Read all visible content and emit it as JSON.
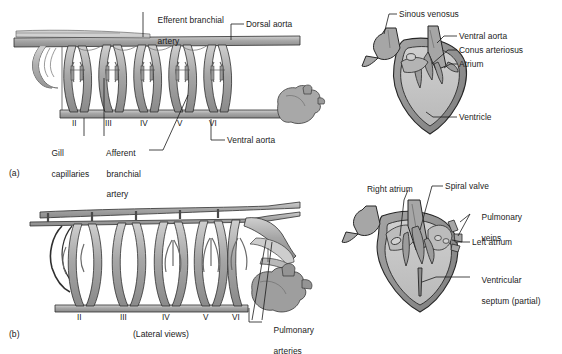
{
  "figure": {
    "caption": "(Lateral views)",
    "panels": [
      {
        "tag": "(a)",
        "name": "fish-aortic-arches-and-heart"
      },
      {
        "tag": "(b)",
        "name": "amphibian-aortic-arches-and-heart"
      }
    ]
  },
  "panel_a_arches": {
    "name": "fish-gill-circulation",
    "labels": {
      "efferent_branchial_artery_line1": "Efferent branchial",
      "efferent_branchial_artery_line2": "artery",
      "dorsal_aorta": "Dorsal aorta",
      "gill_capillaries_line1": "Gill",
      "gill_capillaries_line2": "capillaries",
      "afferent_branchial_artery_line1": "Afferent",
      "afferent_branchial_artery_line2": "branchial",
      "afferent_branchial_artery_line3": "artery",
      "ventral_aorta": "Ventral aorta"
    },
    "arch_numerals": [
      "II",
      "III",
      "IV",
      "V",
      "VI"
    ]
  },
  "panel_a_heart": {
    "name": "fish-heart-section",
    "labels": {
      "sinous_venosus": "Sinous venosus",
      "ventral_aorta": "Ventral aorta",
      "conus_arteriosus": "Conus arteriosus",
      "atrium": "Atrium",
      "ventricle": "Ventricle"
    }
  },
  "panel_b_arches": {
    "name": "amphibian-gill-circulation",
    "labels": {
      "pulmonary_arteries_line1": "Pulmonary",
      "pulmonary_arteries_line2": "arteries"
    },
    "arch_numerals": [
      "II",
      "III",
      "IV",
      "V",
      "VI"
    ]
  },
  "panel_b_heart": {
    "name": "amphibian-heart-section",
    "labels": {
      "right_atrium": "Right atrium",
      "spiral_valve": "Spiral valve",
      "pulmonary_veins_line1": "Pulmonary",
      "pulmonary_veins_line2": "veins",
      "left_atrium": "Left atrium",
      "ventricular_septum_line1": "Ventricular",
      "ventricular_septum_line2": "septum (partial)"
    }
  },
  "colors": {
    "background": "#ffffff",
    "vessel_fill": "#9c9c9c",
    "vessel_fill_light": "#bdbdbd",
    "vessel_outline": "#2e2e2e",
    "heart_wall": "#8e8e8e",
    "heart_lumen": "#c3c3c3",
    "leader_line": "#1a1a1a",
    "text": "#1b1b1b"
  }
}
